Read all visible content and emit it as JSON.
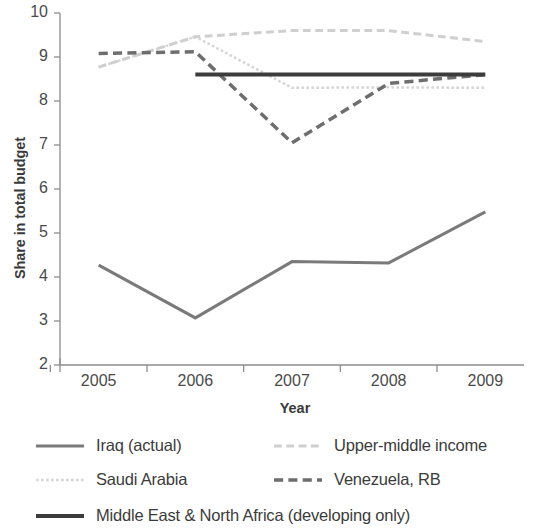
{
  "chart_data": {
    "type": "line",
    "title": "",
    "xlabel": "Year",
    "ylabel": "Share in total budget",
    "categories": [
      "2005",
      "2006",
      "2007",
      "2008",
      "2009"
    ],
    "x": [
      2005,
      2006,
      2007,
      2008,
      2009
    ],
    "xlim": [
      2004.6,
      2009.4
    ],
    "ylim": [
      2,
      10
    ],
    "yticks": [
      2,
      3,
      4,
      5,
      6,
      7,
      8,
      9,
      10
    ],
    "grid": false,
    "legend_position": "bottom",
    "series": [
      {
        "name": "Iraq (actual)",
        "style": "solid",
        "color": "#7a7a7a",
        "width": 3,
        "values": [
          4.27,
          3.07,
          4.35,
          4.32,
          5.48
        ]
      },
      {
        "name": "Saudi Arabia",
        "style": "dotted",
        "color": "#d6d6d6",
        "width": 2.5,
        "values": [
          8.77,
          9.46,
          8.3,
          8.31,
          8.3
        ]
      },
      {
        "name": "Upper-middle income",
        "style": "dashed",
        "color": "#cfcfcf",
        "width": 3,
        "values": [
          8.77,
          9.46,
          9.6,
          9.6,
          9.35
        ]
      },
      {
        "name": "Venezuela, RB",
        "style": "dashed",
        "color": "#6e6e6e",
        "width": 3.5,
        "values": [
          9.08,
          9.12,
          7.05,
          8.4,
          8.6
        ]
      },
      {
        "name": "Middle East & North Africa (developing only)",
        "style": "solid",
        "color": "#3c3c3c",
        "width": 4,
        "values": [
          null,
          8.6,
          8.6,
          8.6,
          8.6
        ]
      }
    ]
  },
  "axis": {
    "y_title": "Share in total budget",
    "x_title": "Year",
    "y_ticks": [
      "10",
      "9",
      "8",
      "7",
      "6",
      "5",
      "4",
      "3",
      "2"
    ],
    "x_ticks": [
      "2005",
      "2006",
      "2007",
      "2008",
      "2009"
    ]
  },
  "legend": {
    "items": [
      {
        "label": "Iraq (actual)",
        "style": "solid",
        "color": "#7a7a7a",
        "width": 3
      },
      {
        "label": "Upper-middle income",
        "style": "dashed",
        "color": "#cfcfcf",
        "width": 3
      },
      {
        "label": "Saudi Arabia",
        "style": "dotted",
        "color": "#d6d6d6",
        "width": 2.5
      },
      {
        "label": "Venezuela, RB",
        "style": "dashed",
        "color": "#6e6e6e",
        "width": 3.5
      },
      {
        "label": "Middle East & North Africa (developing only)",
        "style": "solid",
        "color": "#3c3c3c",
        "width": 4
      }
    ]
  }
}
